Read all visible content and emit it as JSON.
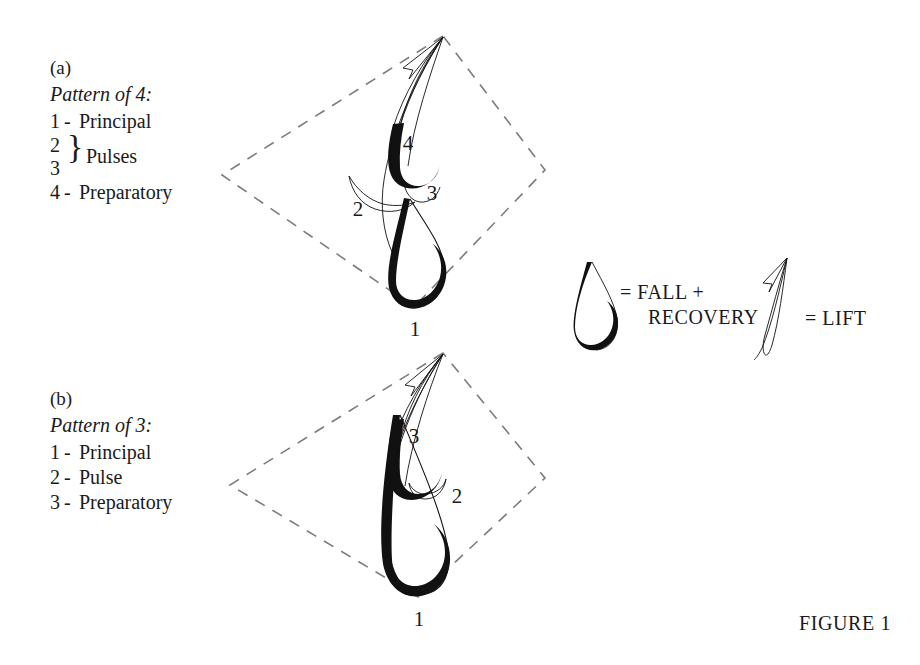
{
  "figure": {
    "caption": "FIGURE 1"
  },
  "panels": [
    {
      "letter": "(a)",
      "title": "Pattern of 4:",
      "lines": [
        {
          "num": "1",
          "sep": "-",
          "text": "Principal"
        },
        {
          "num": "2",
          "sep": "",
          "text": ""
        },
        {
          "num": "3",
          "sep": "",
          "text": ""
        },
        {
          "num": "4",
          "sep": "-",
          "text": "Preparatory"
        }
      ],
      "brace_label": "Pulses",
      "brace_glyph": "}",
      "diagram_labels": [
        "1",
        "2",
        "3",
        "4"
      ]
    },
    {
      "letter": "(b)",
      "title": "Pattern of 3:",
      "lines": [
        {
          "num": "1",
          "sep": "-",
          "text": "Principal"
        },
        {
          "num": "2",
          "sep": "-",
          "text": "Pulse"
        },
        {
          "num": "3",
          "sep": "-",
          "text": "Preparatory"
        }
      ],
      "diagram_labels": [
        "1",
        "2",
        "3"
      ]
    }
  ],
  "legend": {
    "fall_line1": "= FALL +",
    "fall_line2": "RECOVERY",
    "lift": "= LIFT",
    "fall_symbol": "fall-recovery-hook-icon",
    "lift_symbol": "lift-sliver-icon"
  },
  "colors": {
    "ink": "#111111",
    "dashed_guide": "#7b7b83",
    "background": "#ffffff"
  }
}
